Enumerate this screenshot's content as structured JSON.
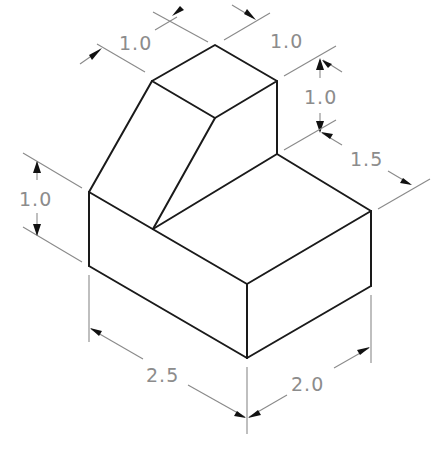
{
  "drawing": {
    "title": "Isometric view of stepped block with sloped face",
    "object_color": "#1a1a1a",
    "dimension_color": "#8a8a8a",
    "background": "#ffffff"
  },
  "dimensions": {
    "top_left_width": "1.0",
    "top_right_depth": "1.0",
    "step_height": "1.0",
    "step_depth": "1.5",
    "base_height": "1.0",
    "base_length": "2.5",
    "base_width": "2.0"
  }
}
